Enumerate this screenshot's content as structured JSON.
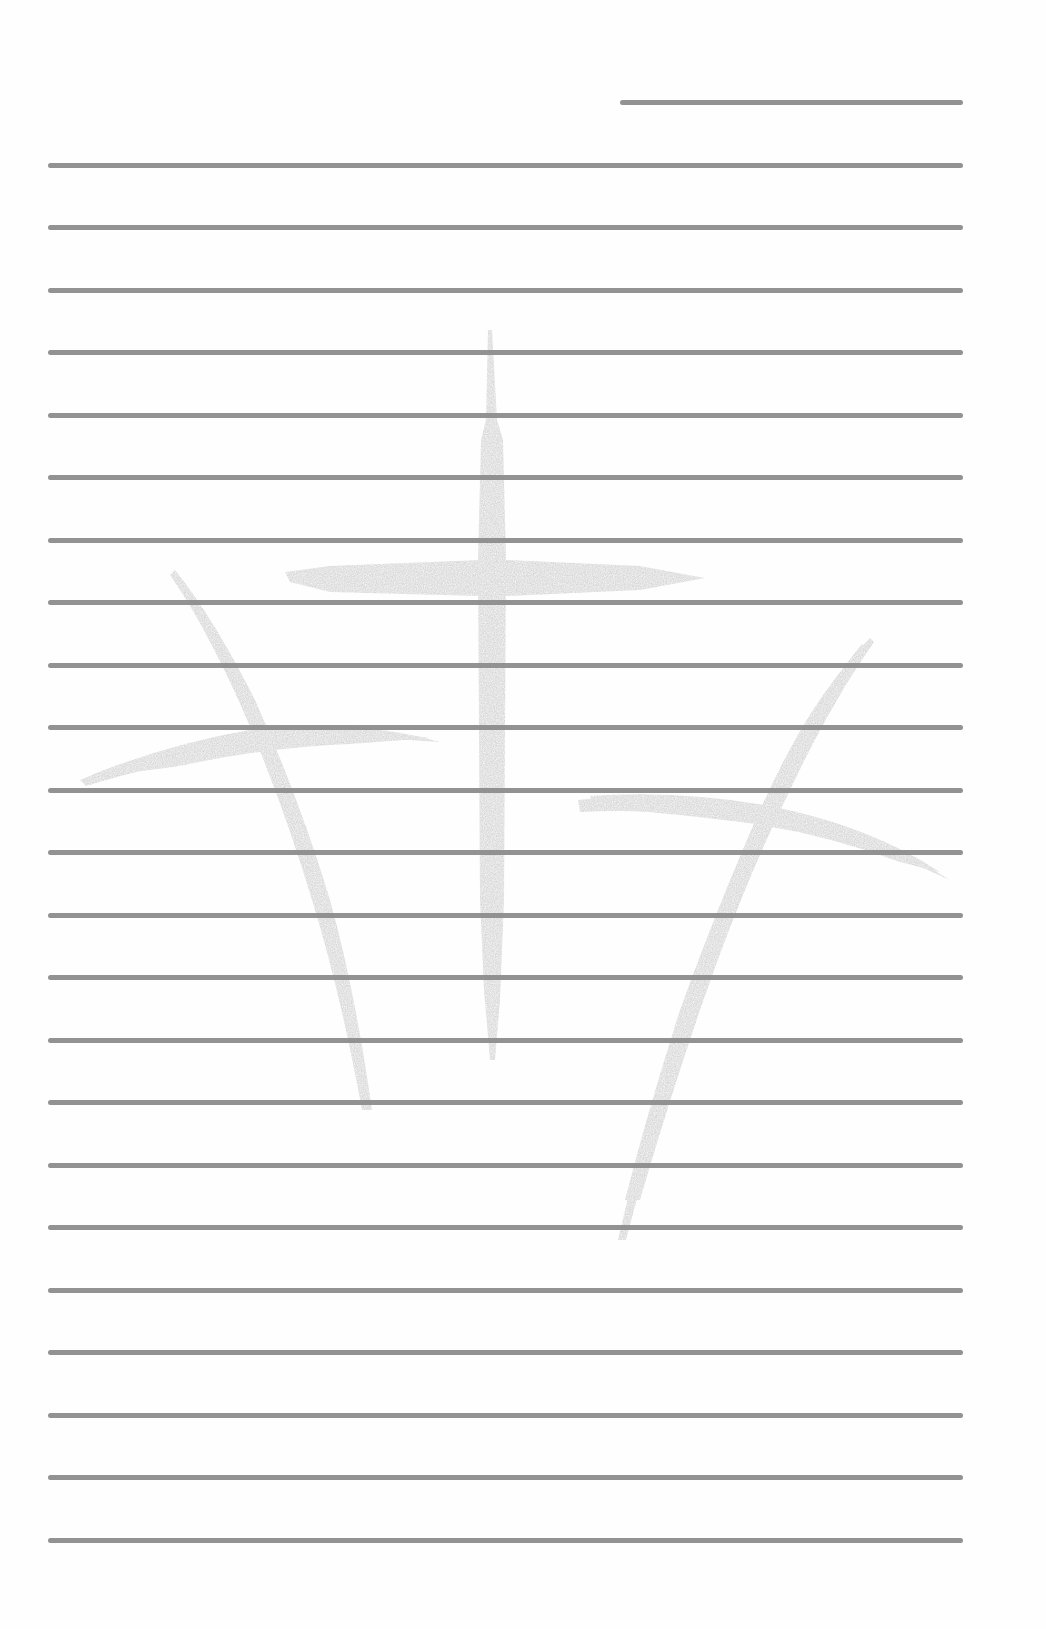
{
  "page": {
    "type": "lined stationery",
    "background_color": "#fefefe",
    "line_color": "#8c8c8c",
    "watermark_color": "#d6d6d6"
  },
  "header_line": {
    "x_start": 620,
    "x_end": 963,
    "y": 102
  },
  "ruled_lines": {
    "count": 23,
    "x_start": 48,
    "x_end": 963,
    "first_y": 165,
    "spacing": 62.5,
    "thickness": 5
  },
  "watermark": {
    "name": "three-crosses",
    "description": "Three brush-stroke crosses, center cross upright, two side crosses tilted"
  }
}
